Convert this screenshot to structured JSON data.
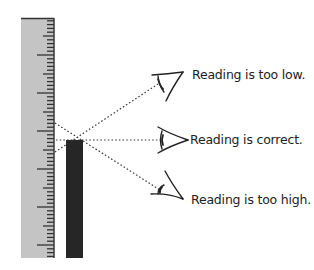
{
  "diagram": {
    "colors": {
      "ruler_fill": "#c4c4c4",
      "ruler_edge": "#3a3a3a",
      "tick": "#333333",
      "column": "#262626",
      "sight_line": "#333333",
      "text": "#222222"
    },
    "ruler": {
      "x": 21,
      "y": 18,
      "width": 33,
      "height": 240,
      "tick_spacing": 3.8,
      "long_every": 10,
      "medium_every": 5
    },
    "column": {
      "x": 66,
      "top": 140,
      "bottom": 258,
      "width": 17
    },
    "eyes": [
      {
        "id": "high-eye",
        "position": "above",
        "label": "Reading is too low."
      },
      {
        "id": "level-eye",
        "position": "level",
        "label": "Reading is correct."
      },
      {
        "id": "low-eye",
        "position": "below",
        "label": "Reading is too high."
      }
    ]
  }
}
